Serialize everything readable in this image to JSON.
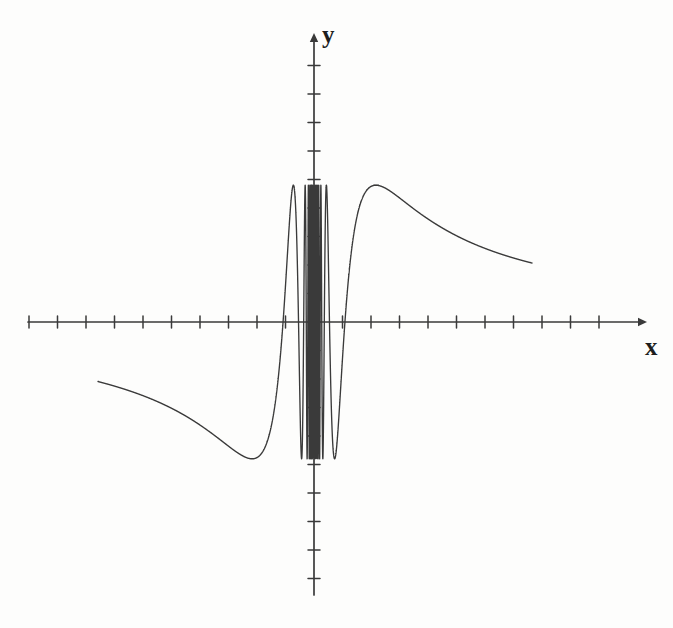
{
  "figure": {
    "background_color": "#fdfdfc",
    "ink_color": "#3a3a3a",
    "axis_color": "#3a3a3a"
  },
  "axes": {
    "x_label": "x",
    "y_label": "y",
    "origin_px": {
      "x": 314,
      "y": 322
    },
    "unit_px": 28.5,
    "x_axis": {
      "start_px": 28,
      "end_px": 638,
      "arrow": "right",
      "tick_count": 21,
      "tick_half_length_px": 6
    },
    "y_axis": {
      "start_px": 595,
      "end_px": 42,
      "arrow": "up",
      "tick_count": 19,
      "tick_half_length_px": 6
    }
  },
  "chart_data": {
    "type": "line",
    "title": "",
    "subtitle": "",
    "xlabel": "x",
    "ylabel": "y",
    "grid": false,
    "legend": null,
    "annotations": [],
    "xlim": [
      -10.0,
      11.4
    ],
    "ylim": [
      -9.8,
      9.8
    ],
    "x_tick_values": [
      -10,
      -9,
      -8,
      -7,
      -6,
      -5,
      -4,
      -3,
      -2,
      -1,
      0,
      1,
      2,
      3,
      4,
      5,
      6,
      7,
      8,
      9,
      10
    ],
    "y_tick_values": [
      -9,
      -8,
      -7,
      -6,
      -5,
      -4,
      -3,
      -2,
      -1,
      0,
      1,
      2,
      3,
      4,
      5,
      6,
      7,
      8,
      9
    ],
    "amplitude": 4.8,
    "curve_domain": [
      -7.58,
      7.65
    ],
    "curve_endpoints": [
      {
        "x": -7.58,
        "y": 2.07
      },
      {
        "x": 7.65,
        "y": -2.07
      }
    ],
    "series": [
      {
        "name": "f(x)",
        "expression": "A*sin(k/x)",
        "x": [
          -7.58,
          -7.2,
          -6.8,
          -6.4,
          -6.0,
          -5.6,
          -5.2,
          -4.8,
          -4.4,
          -4.0,
          -3.6,
          -3.2,
          -2.8,
          -2.4,
          -2.0,
          -1.6,
          -1.2,
          -0.9,
          -0.6,
          -0.4,
          -0.25,
          -0.15,
          -0.08,
          0,
          0.08,
          0.15,
          0.25,
          0.4,
          0.6,
          0.9,
          1.2,
          1.6,
          2.0,
          2.4,
          2.8,
          3.2,
          3.6,
          4.0,
          4.4,
          4.8,
          5.2,
          5.6,
          6.0,
          6.4,
          6.8,
          7.2,
          7.65
        ],
        "y": [
          2.07,
          1.1,
          -0.2,
          -1.6,
          -2.9,
          -4.0,
          -4.6,
          -4.8,
          -4.4,
          -3.4,
          -1.9,
          -0.1,
          1.9,
          3.5,
          4.6,
          4.8,
          3.7,
          1.4,
          -3.2,
          4.6,
          -4.7,
          4.8,
          -4.8,
          0,
          4.8,
          -4.8,
          4.7,
          -4.6,
          3.2,
          -1.4,
          -3.7,
          -4.8,
          -4.6,
          -3.5,
          -1.9,
          0.1,
          1.9,
          3.4,
          4.4,
          4.8,
          4.6,
          4.0,
          2.9,
          1.6,
          0.2,
          -1.1,
          -2.07
        ]
      }
    ],
    "visible_extrema_px": {
      "peaks_y_px": [
        187,
        186,
        185,
        184,
        183
      ],
      "troughs_y_px": [
        463,
        462,
        461,
        464
      ]
    }
  }
}
